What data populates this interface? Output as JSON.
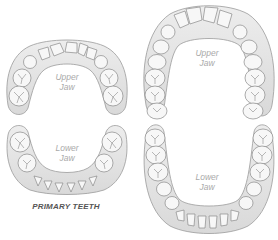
{
  "diagram": {
    "primary": {
      "caption": "PRIMARY TEETH",
      "upper": {
        "label_line1": "Upper",
        "label_line2": "Jaw",
        "teeth_count": 10
      },
      "lower": {
        "label_line1": "Lower",
        "label_line2": "Jaw",
        "teeth_count": 10
      }
    },
    "permanent": {
      "upper": {
        "label_line1": "Upper",
        "label_line2": "Jaw",
        "teeth_count": 14
      },
      "lower": {
        "label_line1": "Lower",
        "label_line2": "Jaw",
        "teeth_count": 14
      }
    },
    "colors": {
      "gum": "#e6e6e6",
      "gum_edge": "#9a9a9a",
      "tooth": "#f7f7f7",
      "tooth_edge": "#8a8a8a",
      "label": "#a9a9a9",
      "caption": "#555555"
    }
  }
}
